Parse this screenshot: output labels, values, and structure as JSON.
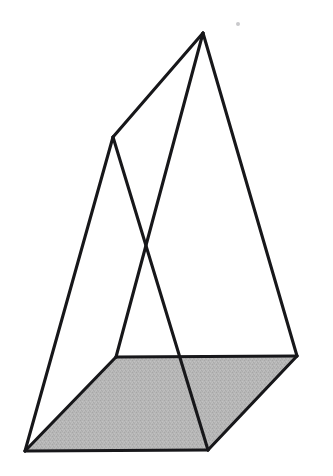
{
  "figure": {
    "background_color": "#ffffff",
    "line_color": "#17171a",
    "line_width": 3.1,
    "shaded_face_color": "#b4b4b4",
    "shaded_face_texture": "dither-noise",
    "canvas": {
      "width": 333,
      "height": 476
    },
    "vertices": {
      "apex_top": {
        "label": "apex-top",
        "x": 203,
        "y": 33
      },
      "peak_left": {
        "label": "peak-left",
        "x": 113,
        "y": 137
      },
      "base_left_mid": {
        "label": "base-left-mid",
        "x": 116,
        "y": 357
      },
      "base_bottom_left": {
        "label": "base-bottom-left",
        "x": 25,
        "y": 451
      },
      "base_bottom_mid": {
        "label": "base-bottom-mid",
        "x": 208,
        "y": 450
      },
      "base_right": {
        "label": "base-right",
        "x": 297,
        "y": 356
      },
      "edge_crossing": {
        "label": "edge-crossing",
        "x": 146,
        "y": 240
      },
      "inner_base_top": {
        "label": "inner-base-top",
        "x": 196,
        "y": 357
      }
    },
    "shaded_face_polygon": "116,357 297,356 208,450 25,451",
    "edges": [
      {
        "name": "apex-to-peak-left",
        "from": "apex_top",
        "to": "peak_left"
      },
      {
        "name": "apex-to-base-right",
        "from": "apex_top",
        "to": "base_right"
      },
      {
        "name": "apex-to-base-left-mid",
        "from": "apex_top",
        "to": "base_left_mid"
      },
      {
        "name": "peak-left-to-base-bottom-left",
        "from": "peak_left",
        "to": "base_bottom_left"
      },
      {
        "name": "peak-left-to-base-bottom-mid",
        "from": "peak_left",
        "to": "base_bottom_mid"
      },
      {
        "name": "base-top-edge",
        "from": "base_left_mid",
        "to": "base_right"
      },
      {
        "name": "base-left-edge",
        "from": "base_left_mid",
        "to": "base_bottom_left"
      },
      {
        "name": "base-bottom-edge",
        "from": "base_bottom_left",
        "to": "base_bottom_mid"
      },
      {
        "name": "base-right-edge",
        "from": "base_bottom_mid",
        "to": "base_right"
      }
    ],
    "artifact_speck": {
      "x": 238,
      "y": 24,
      "radius": 2,
      "color": "#c9c9cc"
    }
  }
}
